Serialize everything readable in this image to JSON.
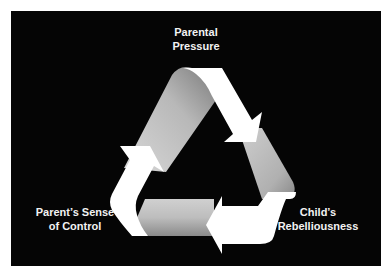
{
  "diagram": {
    "type": "cycle",
    "background": "#050505",
    "arrow_colors": {
      "light": "#ffffff",
      "shade": "#b0b0b0"
    },
    "nodes": [
      {
        "id": "top",
        "lines": [
          "Parental",
          "Pressure"
        ]
      },
      {
        "id": "right",
        "lines": [
          "Child’s",
          "Rebelliousness"
        ]
      },
      {
        "id": "left",
        "lines": [
          "Parent’s Sense",
          "of Control"
        ]
      }
    ],
    "edges": [
      {
        "from": "Parental Pressure",
        "to": "Child’s Rebelliousness"
      },
      {
        "from": "Child’s Rebelliousness",
        "to": "Parent’s Sense of Control"
      },
      {
        "from": "Parent’s Sense of Control",
        "to": "Parental Pressure"
      }
    ]
  }
}
